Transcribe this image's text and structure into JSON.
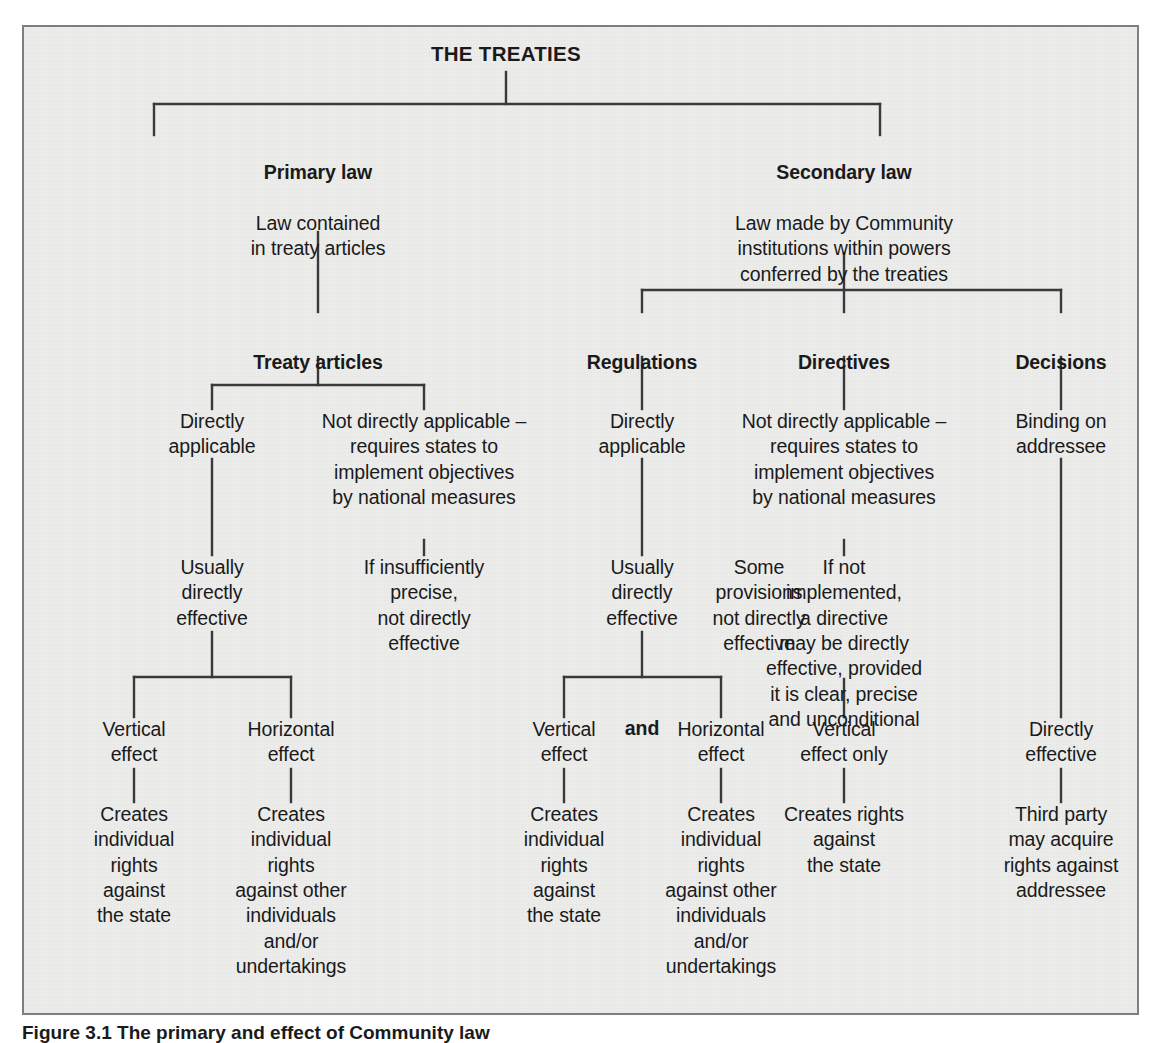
{
  "figure": {
    "caption": "Figure 3.1 The primary and effect of Community law",
    "background_color": "#ececeb",
    "border_color": "#7e7e7e",
    "line_color": "#3a3a3a",
    "text_color": "#1a1a1a"
  },
  "diagram": {
    "type": "tree",
    "root": {
      "id": "the-treaties",
      "title": "THE TREATIES"
    },
    "level2": [
      {
        "id": "primary-law",
        "heading": "Primary law",
        "body": "Law contained\nin treaty articles"
      },
      {
        "id": "secondary-law",
        "heading": "Secondary law",
        "body": "Law made by Community\ninstitutions within powers\nconferred by the treaties"
      }
    ],
    "level3": [
      {
        "id": "treaty-articles",
        "heading": "Treaty articles"
      },
      {
        "id": "regulations",
        "heading": "Regulations"
      },
      {
        "id": "directives",
        "heading": "Directives"
      },
      {
        "id": "decisions",
        "heading": "Decisions"
      }
    ],
    "level4": [
      {
        "id": "ta-directly-applicable",
        "body": "Directly\napplicable"
      },
      {
        "id": "ta-not-directly-applicable",
        "body": "Not directly applicable –\nrequires states to\nimplement objectives\nby national measures"
      },
      {
        "id": "reg-directly-applicable",
        "body": "Directly\napplicable"
      },
      {
        "id": "dir-not-directly-applicable",
        "body": "Not directly applicable –\nrequires states to\nimplement objectives\nby national measures"
      },
      {
        "id": "dec-binding-on-addressee",
        "body": "Binding on\naddressee"
      }
    ],
    "level5": [
      {
        "id": "ta-usually-directly-effective",
        "body": "Usually\ndirectly\neffective"
      },
      {
        "id": "ta-if-insufficiently-precise",
        "body": "If insufficiently\nprecise,\nnot directly\neffective"
      },
      {
        "id": "reg-usually-directly-effective",
        "body": "Usually\ndirectly\neffective"
      },
      {
        "id": "reg-some-provisions",
        "body": "Some\nprovisions\nnot directly\neffective"
      },
      {
        "id": "dir-if-not-implemented",
        "body": "If not\nimplemented,\na directive\nmay be directly\neffective, provided\nit is clear, precise\nand unconditional"
      }
    ],
    "level6": [
      {
        "id": "ta-vertical-effect",
        "body": "Vertical\neffect"
      },
      {
        "id": "ta-horizontal-effect",
        "body": "Horizontal\neffect"
      },
      {
        "id": "reg-vertical-effect",
        "body": "Vertical\neffect"
      },
      {
        "id": "reg-horizontal-effect",
        "body": "Horizontal\neffect"
      },
      {
        "id": "dir-vertical-effect-only",
        "body": "Vertical\neffect only"
      },
      {
        "id": "dec-directly-effective",
        "body": "Directly\neffective"
      }
    ],
    "conjunction": "and",
    "level7": [
      {
        "id": "ta-vertical-outcome",
        "body": "Creates\nindividual\nrights\nagainst\nthe state"
      },
      {
        "id": "ta-horizontal-outcome",
        "body": "Creates\nindividual\nrights\nagainst other\nindividuals\nand/or\nundertakings"
      },
      {
        "id": "reg-vertical-outcome",
        "body": "Creates\nindividual\nrights\nagainst\nthe state"
      },
      {
        "id": "reg-horizontal-outcome",
        "body": "Creates\nindividual\nrights\nagainst other\nindividuals\nand/or\nundertakings"
      },
      {
        "id": "dir-outcome",
        "body": "Creates rights\nagainst\nthe state"
      },
      {
        "id": "dec-outcome",
        "body": "Third party\nmay acquire\nrights against\naddressee"
      }
    ]
  }
}
